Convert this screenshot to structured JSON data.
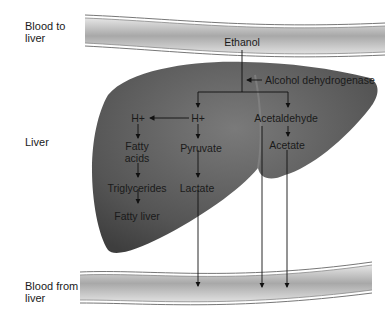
{
  "side_labels": {
    "blood_to_liver": [
      "Blood to",
      "liver"
    ],
    "liver": "Liver",
    "blood_from_liver": [
      "Blood from",
      "liver"
    ]
  },
  "nodes": {
    "ethanol": "Ethanol",
    "enzyme": "Alcohol dehydrogenase",
    "h_plus_left": "H+",
    "h_plus_center": "H+",
    "fatty_acids": [
      "Fatty",
      "acids"
    ],
    "triglycerides": "Triglycerides",
    "fatty_liver": "Fatty liver",
    "pyruvate": "Pyruvate",
    "lactate": "Lactate",
    "acetaldehyde": "Acetaldehyde",
    "acetate": "Acetate"
  },
  "colors": {
    "vessel_fill": "#b8b8b8",
    "vessel_edge": "#6a6a6a",
    "liver_fill": "#5a5a5a",
    "text": "#1a1a1a"
  }
}
